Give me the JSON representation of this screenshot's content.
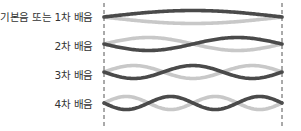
{
  "diagram": {
    "title": "",
    "colors": {
      "wave_dark": "#4a4a4a",
      "wave_light": "#c8c8c8",
      "boundary": "#555555",
      "label": "#333333"
    },
    "boundaries": {
      "left_x": 104,
      "right_x": 282,
      "top_y": 3,
      "bottom_y": 127
    },
    "harmonics": [
      {
        "label": "기본음 또는 1차 배음",
        "n": 1,
        "center_y": 17,
        "amplitude": 6.5,
        "label_y": 11
      },
      {
        "label": "2차 배음",
        "n": 2,
        "center_y": 44,
        "amplitude": 6.5,
        "label_y": 40
      },
      {
        "label": "3차 배음",
        "n": 3,
        "center_y": 72,
        "amplitude": 6.5,
        "label_y": 69
      },
      {
        "label": "4차 배음",
        "n": 4,
        "center_y": 103,
        "amplitude": 6.5,
        "label_y": 98
      }
    ]
  }
}
